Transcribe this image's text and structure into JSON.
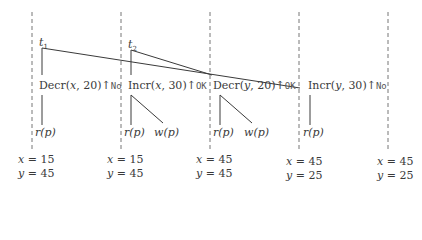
{
  "transactions": [
    {
      "name": "t",
      "sub": "1"
    },
    {
      "name": "t",
      "sub": "2"
    }
  ],
  "operations": [
    {
      "op": "Decr",
      "var": "x",
      "amt": "20",
      "result": "No"
    },
    {
      "op": "Incr",
      "var": "x",
      "amt": "30",
      "result": "OK"
    },
    {
      "op": "Decr",
      "var": "y",
      "amt": "20",
      "result": "OK"
    },
    {
      "op": "Incr",
      "var": "y",
      "amt": "30",
      "result": "No"
    }
  ],
  "reads_writes": {
    "r": "r",
    "w": "w",
    "p": "p"
  },
  "states": [
    {
      "x": "15",
      "y": "45"
    },
    {
      "x": "15",
      "y": "45"
    },
    {
      "x": "45",
      "y": "45"
    },
    {
      "x": "45",
      "y": "25"
    },
    {
      "x": "45",
      "y": "25"
    }
  ],
  "symbols": {
    "arrow": "↑",
    "eq": " = ",
    "comma": ", ",
    "lparen": "(",
    "rparen": ")"
  },
  "colors": {
    "line": "#3a3a3a",
    "dash": "#777777",
    "text": "#3a3a3a"
  }
}
